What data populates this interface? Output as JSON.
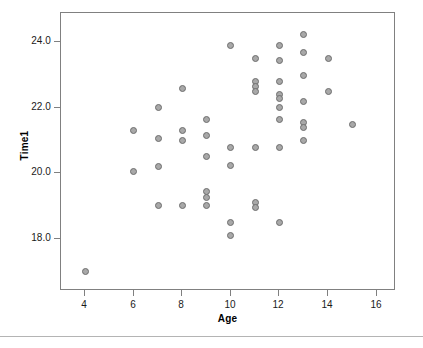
{
  "chart_data": {
    "type": "scatter",
    "title": "",
    "xlabel": "Age",
    "ylabel": "Time1",
    "xlim": [
      3.0,
      16.8
    ],
    "ylim": [
      16.4,
      24.9
    ],
    "xticks": [
      4,
      6,
      8,
      10,
      12,
      14,
      16
    ],
    "xtick_labels": [
      "4",
      "6",
      "8",
      "10",
      "12",
      "14",
      "16"
    ],
    "yticks": [
      18.0,
      20.0,
      22.0,
      24.0
    ],
    "ytick_labels": [
      "18.0",
      "20.0",
      "22.0",
      "24.0"
    ],
    "grid": false,
    "legend": false,
    "marker": {
      "shape": "circle",
      "fill_color": "#a8a8a8",
      "edge_color": "#6e6e6e",
      "size_px": 7
    },
    "frame_color": "#808080",
    "background_color": "#ffffff",
    "n_points": 47,
    "points": [
      {
        "x": 4,
        "y": 17.0
      },
      {
        "x": 6,
        "y": 21.3
      },
      {
        "x": 6,
        "y": 20.05
      },
      {
        "x": 7,
        "y": 22.0
      },
      {
        "x": 7,
        "y": 21.05
      },
      {
        "x": 7,
        "y": 20.2
      },
      {
        "x": 7,
        "y": 19.0
      },
      {
        "x": 8,
        "y": 22.6
      },
      {
        "x": 8,
        "y": 21.3
      },
      {
        "x": 8,
        "y": 21.0
      },
      {
        "x": 8,
        "y": 19.0
      },
      {
        "x": 9,
        "y": 21.65
      },
      {
        "x": 9,
        "y": 21.15
      },
      {
        "x": 9,
        "y": 20.5
      },
      {
        "x": 9,
        "y": 19.45
      },
      {
        "x": 9,
        "y": 19.25
      },
      {
        "x": 9,
        "y": 19.0
      },
      {
        "x": 10,
        "y": 23.9
      },
      {
        "x": 10,
        "y": 20.8
      },
      {
        "x": 10,
        "y": 20.25
      },
      {
        "x": 10,
        "y": 18.5
      },
      {
        "x": 10,
        "y": 18.1
      },
      {
        "x": 11,
        "y": 23.5
      },
      {
        "x": 11,
        "y": 22.8
      },
      {
        "x": 11,
        "y": 22.65
      },
      {
        "x": 11,
        "y": 22.5
      },
      {
        "x": 11,
        "y": 20.8
      },
      {
        "x": 11,
        "y": 19.1
      },
      {
        "x": 11,
        "y": 18.95
      },
      {
        "x": 12,
        "y": 23.9
      },
      {
        "x": 12,
        "y": 23.45
      },
      {
        "x": 12,
        "y": 22.8
      },
      {
        "x": 12,
        "y": 22.4
      },
      {
        "x": 12,
        "y": 22.3
      },
      {
        "x": 12,
        "y": 22.0
      },
      {
        "x": 12,
        "y": 21.65
      },
      {
        "x": 12,
        "y": 20.8
      },
      {
        "x": 12,
        "y": 18.5
      },
      {
        "x": 13,
        "y": 24.25
      },
      {
        "x": 13,
        "y": 23.7
      },
      {
        "x": 13,
        "y": 23.0
      },
      {
        "x": 13,
        "y": 22.2
      },
      {
        "x": 13,
        "y": 21.55
      },
      {
        "x": 13,
        "y": 21.4
      },
      {
        "x": 13,
        "y": 21.0
      },
      {
        "x": 14,
        "y": 23.5
      },
      {
        "x": 14,
        "y": 22.5
      },
      {
        "x": 15,
        "y": 21.5
      }
    ]
  }
}
